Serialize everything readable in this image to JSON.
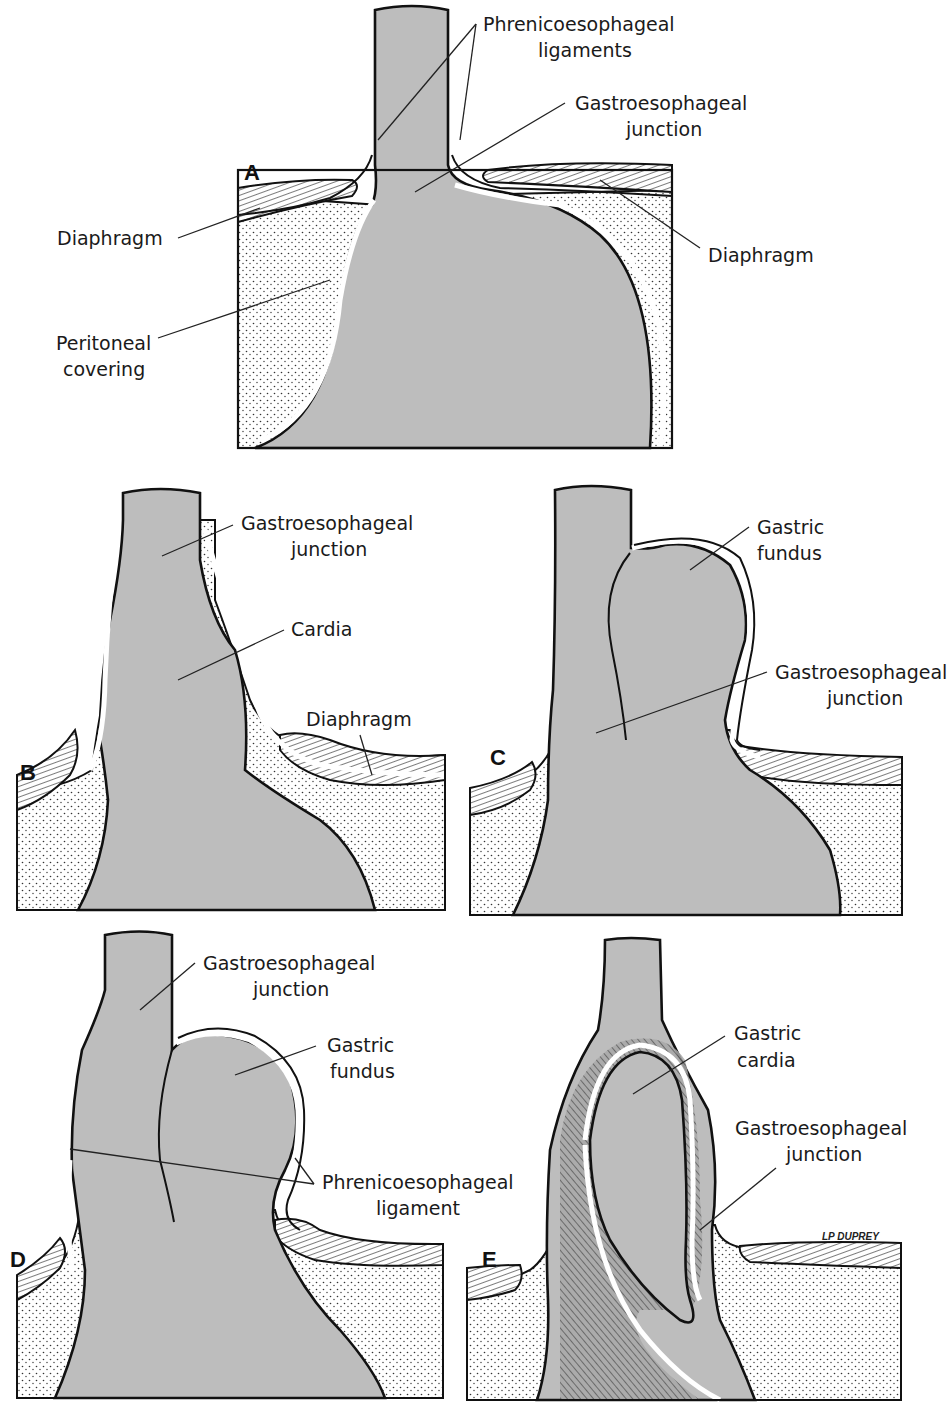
{
  "figure": {
    "colors": {
      "organ_fill": "#bdbdbd",
      "outline": "#111111",
      "background": "#ffffff"
    },
    "signature": "LP DUPREY",
    "panels": [
      {
        "id": "A",
        "label": "A",
        "annotations": [
          {
            "text_lines": [
              "Phrenicoesophageal",
              "ligaments"
            ]
          },
          {
            "text_lines": [
              "Gastroesophageal",
              "junction"
            ]
          },
          {
            "text_lines": [
              "Diaphragm"
            ],
            "side": "left"
          },
          {
            "text_lines": [
              "Diaphragm"
            ],
            "side": "right"
          },
          {
            "text_lines": [
              "Peritoneal",
              "covering"
            ]
          }
        ]
      },
      {
        "id": "B",
        "label": "B",
        "annotations": [
          {
            "text_lines": [
              "Gastroesophageal",
              "junction"
            ]
          },
          {
            "text_lines": [
              "Cardia"
            ]
          },
          {
            "text_lines": [
              "Diaphragm"
            ]
          }
        ]
      },
      {
        "id": "C",
        "label": "C",
        "annotations": [
          {
            "text_lines": [
              "Gastric",
              "fundus"
            ]
          },
          {
            "text_lines": [
              "Gastroesophageal",
              "junction"
            ]
          }
        ]
      },
      {
        "id": "D",
        "label": "D",
        "annotations": [
          {
            "text_lines": [
              "Gastroesophageal",
              "junction"
            ]
          },
          {
            "text_lines": [
              "Gastric",
              "fundus"
            ]
          },
          {
            "text_lines": [
              "Phrenicoesophageal",
              "ligament"
            ]
          }
        ]
      },
      {
        "id": "E",
        "label": "E",
        "annotations": [
          {
            "text_lines": [
              "Gastric",
              "cardia"
            ]
          },
          {
            "text_lines": [
              "Gastroesophageal",
              "junction"
            ]
          }
        ]
      }
    ]
  }
}
